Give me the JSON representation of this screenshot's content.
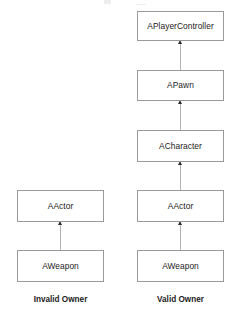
{
  "diagram": {
    "type": "uml-class-inheritance",
    "title": "",
    "columns": [
      {
        "id": "invalid-owner",
        "caption": "Invalid Owner",
        "caption_x": 60.5,
        "caption_y": 296,
        "box_left": 17,
        "box_width": 87,
        "connector_x": 60.5,
        "nodes": [
          {
            "label": "AActor",
            "top": 190,
            "height": 32
          },
          {
            "label": "AWeapon",
            "top": 250,
            "height": 32
          }
        ],
        "edges": [
          {
            "from": "AWeapon",
            "to": "AActor",
            "kind": "generalization"
          }
        ]
      },
      {
        "id": "valid-owner",
        "caption": "Valid Owner",
        "caption_x": 180.5,
        "caption_y": 296,
        "box_left": 137,
        "box_width": 87,
        "connector_x": 180.5,
        "nodes": [
          {
            "label": "APlayerController",
            "top": 11,
            "height": 30
          },
          {
            "label": "APawn",
            "top": 70,
            "height": 31
          },
          {
            "label": "ACharacter",
            "top": 130,
            "height": 32
          },
          {
            "label": "AActor",
            "top": 190,
            "height": 32
          },
          {
            "label": "AWeapon",
            "top": 250,
            "height": 32
          }
        ],
        "edges": [
          {
            "from": "APawn",
            "to": "APlayerController",
            "kind": "generalization"
          },
          {
            "from": "ACharacter",
            "to": "APawn",
            "kind": "generalization"
          },
          {
            "from": "AActor",
            "to": "ACharacter",
            "kind": "generalization"
          },
          {
            "from": "AWeapon",
            "to": "AActor",
            "kind": "generalization"
          }
        ]
      }
    ],
    "colors": {
      "box_fill": "#ffffff",
      "box_border": "#9a9a9a",
      "connector": "#b4b4b4",
      "arrowhead": "#2b2b2b",
      "text": "#232323",
      "caption_text": "#1c1c1c",
      "background": "#ffffff"
    }
  }
}
